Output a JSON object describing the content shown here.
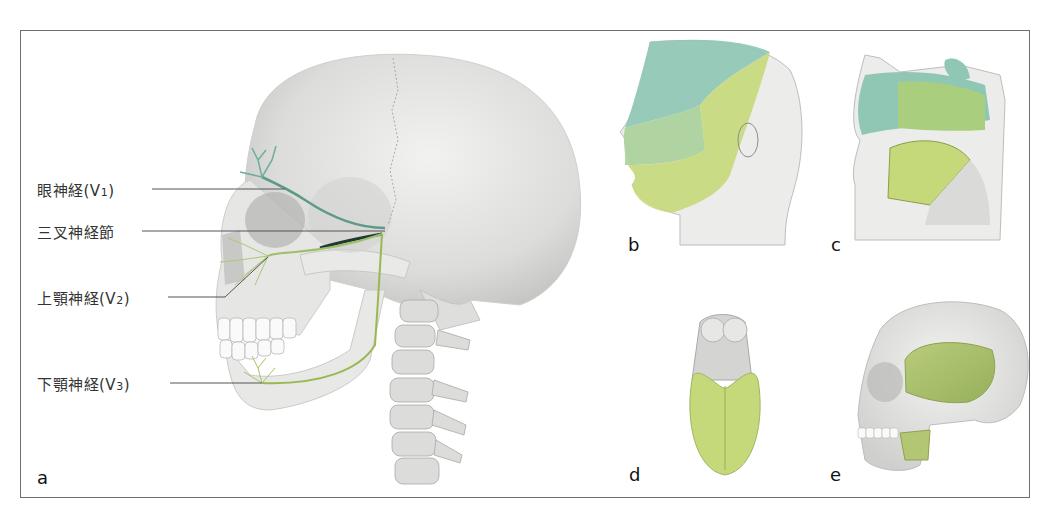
{
  "figure": {
    "panels": [
      {
        "id": "a",
        "letter": "a",
        "subject": "skull-lateral-trigeminal-nerve-branches"
      },
      {
        "id": "b",
        "letter": "b",
        "subject": "head-dermatomes-trigeminal"
      },
      {
        "id": "c",
        "letter": "c",
        "subject": "nasal-oral-cavity-sagittal"
      },
      {
        "id": "d",
        "letter": "d",
        "subject": "tongue-anterior-two-thirds"
      },
      {
        "id": "e",
        "letter": "e",
        "subject": "skull-masticatory-muscles"
      }
    ],
    "labels": [
      {
        "id": "v1",
        "text": "眼神経(V",
        "sub": "1",
        "close": ")"
      },
      {
        "id": "ganglion",
        "text": "三叉神経節",
        "sub": "",
        "close": ""
      },
      {
        "id": "v2",
        "text": "上顎神経(V",
        "sub": "2",
        "close": ")"
      },
      {
        "id": "v3",
        "text": "下顎神経(V",
        "sub": "3",
        "close": ")"
      }
    ],
    "colors": {
      "frame": "#6e6e6e",
      "bone": "#e4e4e2",
      "bone_shade": "#c9c9c7",
      "nerve_v1": "#5e9a8a",
      "nerve_v2": "#9dbf6a",
      "nerve_v3": "#9ab84e",
      "zone_v1": "#8fc7b4",
      "zone_v2": "#b7d48a",
      "zone_v3": "#cdd87a",
      "leader": "#555555"
    }
  }
}
